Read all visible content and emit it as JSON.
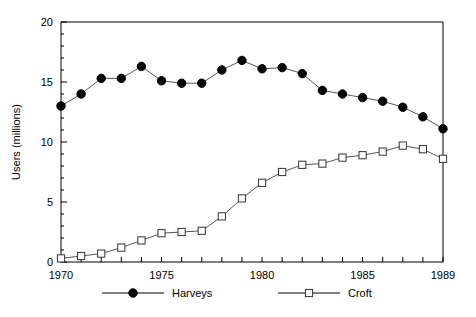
{
  "chart_data": {
    "type": "line",
    "title": "",
    "xlabel": "",
    "ylabel": "Users (millions)",
    "xlim": [
      1970,
      1989
    ],
    "ylim": [
      0,
      20
    ],
    "grid": false,
    "legend_position": "bottom",
    "x": [
      1970,
      1971,
      1972,
      1973,
      1974,
      1975,
      1976,
      1977,
      1978,
      1979,
      1980,
      1981,
      1982,
      1983,
      1984,
      1985,
      1986,
      1987,
      1988,
      1989
    ],
    "xtick_labels": [
      "1970",
      "1975",
      "1980",
      "1985",
      "1989"
    ],
    "xtick_values": [
      1970,
      1975,
      1980,
      1985,
      1989
    ],
    "ytick_labels": [
      "0",
      "5",
      "10",
      "15",
      "20"
    ],
    "ytick_values": [
      0,
      5,
      10,
      15,
      20
    ],
    "series": [
      {
        "name": "Harveys",
        "marker": "filled-circle",
        "values": [
          13.0,
          14.0,
          15.3,
          15.3,
          16.3,
          15.1,
          14.9,
          14.9,
          16.0,
          16.8,
          16.1,
          16.2,
          15.7,
          14.3,
          14.0,
          13.7,
          13.4,
          12.9,
          12.1,
          11.1
        ]
      },
      {
        "name": "Croft",
        "marker": "open-square",
        "values": [
          0.3,
          0.5,
          0.7,
          1.2,
          1.8,
          2.4,
          2.5,
          2.6,
          3.8,
          5.3,
          6.6,
          7.5,
          8.1,
          8.2,
          8.7,
          8.9,
          9.2,
          9.7,
          9.4,
          8.6
        ]
      }
    ]
  },
  "legend": {
    "items": [
      {
        "label": "Harveys",
        "marker": "filled-circle"
      },
      {
        "label": "Croft",
        "marker": "open-square"
      }
    ]
  },
  "colors": {
    "series_line": "#555555",
    "axis": "#000000",
    "background": "#ffffff",
    "marker_fill_harveys": "#000000",
    "marker_fill_croft": "#ffffff"
  }
}
